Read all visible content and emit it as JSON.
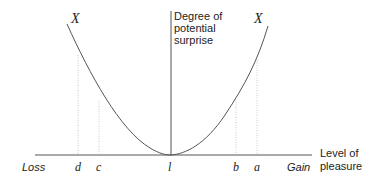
{
  "diagram": {
    "y_axis_label": [
      "Degree of",
      "potential",
      "surprise"
    ],
    "x_axis_label": [
      "Level of",
      "pleasure"
    ],
    "x_axis_left_end": "Loss",
    "x_axis_right_end": "Gain",
    "curve_labels": {
      "left": "X",
      "right": "X"
    },
    "tick_labels": {
      "d": "d",
      "c": "c",
      "origin": "l",
      "b": "b",
      "a": "a"
    },
    "colors": {
      "line": "#555555",
      "dotted": "#bbbbbb",
      "text": "#222222"
    }
  }
}
